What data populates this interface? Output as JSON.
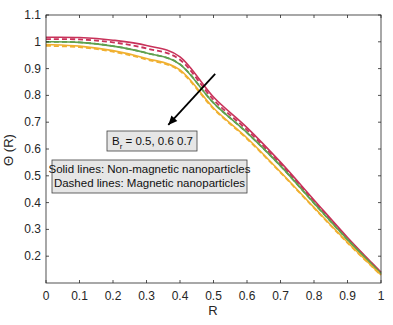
{
  "chart_data": {
    "type": "line",
    "title": "",
    "xlabel": "R",
    "ylabel": "Θ (R)",
    "xlim": [
      0,
      1
    ],
    "ylim": [
      0.1,
      1.1
    ],
    "xticks": [
      "0",
      "0.1",
      "0.2",
      "0.3",
      "0.4",
      "0.5",
      "0.6",
      "0.7",
      "0.8",
      "0.9",
      "1"
    ],
    "yticks": [
      "0.2",
      "0.3",
      "0.4",
      "0.5",
      "0.6",
      "0.7",
      "0.8",
      "0.9",
      "1",
      "1.1"
    ],
    "grid": false,
    "x": [
      0,
      0.1,
      0.2,
      0.3,
      0.4,
      0.5,
      0.6,
      0.7,
      0.8,
      0.9,
      1.0
    ],
    "series": [
      {
        "name": "Br = 0.7, Non-magnetic nanoparticles",
        "style": "solid",
        "color": "#c8325a",
        "values": [
          1.017,
          1.016,
          1.006,
          0.986,
          0.944,
          0.794,
          0.68,
          0.551,
          0.41,
          0.27,
          0.14
        ]
      },
      {
        "name": "Br = 0.7, Magnetic nanoparticles",
        "style": "dashed",
        "color": "#c8325a",
        "values": [
          1.01,
          1.009,
          0.998,
          0.975,
          0.933,
          0.784,
          0.671,
          0.544,
          0.405,
          0.266,
          0.138
        ]
      },
      {
        "name": "Br = 0.6, Non-magnetic nanoparticles",
        "style": "solid",
        "color": "#5fa04e",
        "values": [
          1.0,
          0.998,
          0.984,
          0.958,
          0.916,
          0.772,
          0.661,
          0.537,
          0.398,
          0.262,
          0.135
        ]
      },
      {
        "name": "Br = 0.6, Magnetic nanoparticles",
        "style": "dashed",
        "color": "#5fa04e",
        "values": [
          1.0,
          0.998,
          0.984,
          0.958,
          0.916,
          0.772,
          0.661,
          0.537,
          0.398,
          0.262,
          0.135
        ]
      },
      {
        "name": "Br = 0.5, Non-magnetic nanoparticles",
        "style": "solid",
        "color": "#f0b030",
        "values": [
          0.99,
          0.984,
          0.967,
          0.938,
          0.895,
          0.753,
          0.641,
          0.514,
          0.382,
          0.252,
          0.13
        ]
      },
      {
        "name": "Br = 0.5, Magnetic nanoparticles",
        "style": "dashed",
        "color": "#f0b030",
        "values": [
          0.985,
          0.98,
          0.963,
          0.934,
          0.891,
          0.75,
          0.638,
          0.512,
          0.38,
          0.25,
          0.129
        ]
      }
    ],
    "annotations": [
      {
        "text_main": "B",
        "text_sub": "r",
        "text_rest": " = 0.5, 0.6 0.7",
        "type": "textbox-with-arrow"
      },
      {
        "lines": [
          "Solid lines: Non-magnetic nanoparticles",
          "Dashed lines: Magnetic nanoparticles"
        ],
        "type": "legend-textbox"
      }
    ],
    "arrow": {
      "from_R": 0.505,
      "from_theta": 0.88,
      "to_R": 0.365,
      "to_theta": 0.69
    }
  }
}
